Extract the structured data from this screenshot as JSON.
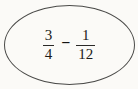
{
  "expression": {
    "fraction1": {
      "numerator": "3",
      "denominator": "4"
    },
    "operator": "−",
    "fraction2": {
      "numerator": "1",
      "denominator": "12"
    }
  },
  "colors": {
    "background": "#fbfaf7",
    "ellipse_stroke": "#4a4a48",
    "text": "#1c1b19"
  }
}
